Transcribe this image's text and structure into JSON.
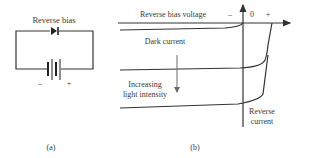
{
  "panel_a": {
    "title": "Reverse bias",
    "battery_minus": "–",
    "battery_plus": "+",
    "caption": "(a)",
    "components": [
      "diode",
      "battery"
    ]
  },
  "panel_b": {
    "x_axis_label": "Reverse bias voltage",
    "x_minus": "–",
    "x_zero": "0",
    "x_plus": "+",
    "dark_current_label": "Dark current",
    "arrow_label_line1": "Increasing",
    "arrow_label_line2": "light intensity",
    "y_axis_label_line1": "Reverse",
    "y_axis_label_line2": "current",
    "caption": "(b)",
    "curves": [
      "dark current (no light)",
      "medium light intensity",
      "high light intensity"
    ]
  }
}
